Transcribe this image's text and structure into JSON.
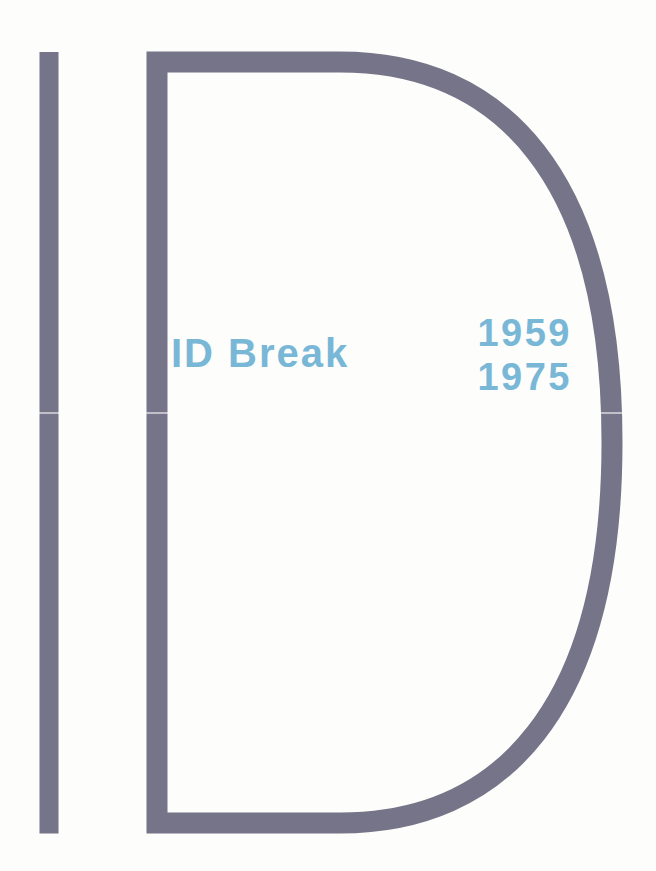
{
  "page": {
    "kind": "publication-divider-page",
    "logo_letters": "ID"
  },
  "title": {
    "text": "ID Break"
  },
  "years": {
    "start": "1959",
    "end": "1975"
  },
  "colors": {
    "background": "#fdfdfc",
    "logo": "#767488",
    "accent": "#79b7d7",
    "fold_seam": "rgba(255,255,255,0.55)"
  }
}
